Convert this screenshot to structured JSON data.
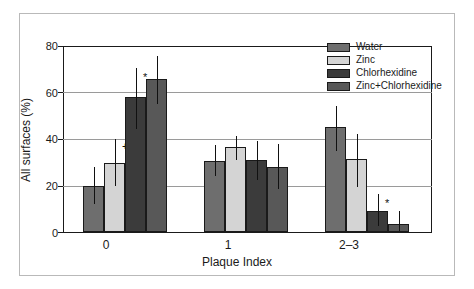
{
  "chart_data": {
    "type": "bar",
    "title": "",
    "xlabel": "Plaque Index",
    "ylabel": "All surfaces (%)",
    "categories": [
      "0",
      "1",
      "2–3"
    ],
    "ylim": [
      0,
      80
    ],
    "yticks": [
      0,
      20,
      40,
      60,
      80
    ],
    "grid": "horizontal",
    "legend_position": "top-right",
    "series": [
      {
        "name": "Water",
        "color": "#6e6e6e",
        "values": [
          20.0,
          30.5,
          45.0
        ],
        "err_low": [
          12.0,
          24.0,
          35.0
        ],
        "err_high": [
          28.0,
          37.5,
          54.0
        ],
        "markers": [
          "",
          "",
          ""
        ]
      },
      {
        "name": "Zinc",
        "color": "#d4d4d4",
        "values": [
          29.5,
          36.5,
          31.5
        ],
        "err_low": [
          20.0,
          31.0,
          19.5
        ],
        "err_high": [
          40.0,
          41.5,
          42.0
        ],
        "markers": [
          "+",
          "",
          ""
        ]
      },
      {
        "name": "Chlorhexidine",
        "color": "#3b3b3b",
        "values": [
          58.0,
          31.0,
          9.0
        ],
        "err_low": [
          44.5,
          22.5,
          2.5
        ],
        "err_high": [
          70.5,
          39.0,
          16.5
        ],
        "markers": [
          "*",
          "",
          "*"
        ]
      },
      {
        "name": "Zinc+Chlorhexidine",
        "color": "#585858",
        "values": [
          66.0,
          28.0,
          3.5
        ],
        "err_low": [
          55.0,
          18.5,
          0.5
        ],
        "err_high": [
          75.5,
          38.0,
          9.0
        ],
        "markers": [
          "",
          "",
          ""
        ]
      }
    ],
    "annotations": [
      {
        "text": "+",
        "series": "Zinc",
        "category": "0"
      },
      {
        "text": "*",
        "series": "Chlorhexidine",
        "category": "0"
      },
      {
        "text": "*",
        "series": "Chlorhexidine",
        "category": "2–3"
      }
    ]
  },
  "legend": {
    "items": [
      {
        "label": "Water",
        "color": "#6e6e6e"
      },
      {
        "label": "Zinc",
        "color": "#d4d4d4"
      },
      {
        "label": "Chlorhexidine",
        "color": "#3b3b3b"
      },
      {
        "label": "Zinc+Chlorhexidine",
        "color": "#585858"
      }
    ]
  },
  "axes": {
    "y_tick_labels": [
      "80",
      "60",
      "40",
      "20",
      "0"
    ],
    "x_tick_labels": [
      "0",
      "1",
      "2–3"
    ],
    "x_title": "Plaque Index",
    "y_title": "All surfaces (%)"
  }
}
